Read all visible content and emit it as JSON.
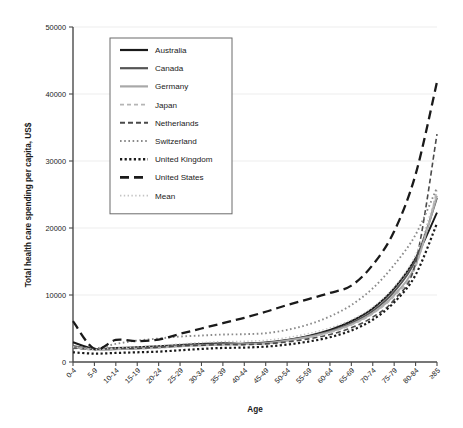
{
  "chart_data": {
    "type": "line",
    "title": "",
    "xlabel": "Age",
    "ylabel": "Total health care spending per capita, US$",
    "ylim": [
      0,
      50000
    ],
    "y_ticks": [
      0,
      10000,
      20000,
      30000,
      40000,
      50000
    ],
    "grid": true,
    "legend_position": "upper-left-inside",
    "categories": [
      "0-4",
      "5-9",
      "10-14",
      "15-19",
      "20-24",
      "25-29",
      "30-34",
      "35-39",
      "40-44",
      "45-49",
      "50-54",
      "55-59",
      "60-64",
      "65-69",
      "70-74",
      "75-79",
      "80-84",
      "≥85"
    ],
    "series": [
      {
        "name": "Australia",
        "style": "solid",
        "color": "#1a1a1a",
        "width": 1.9,
        "values": [
          2950,
          1950,
          2100,
          2200,
          2350,
          2550,
          2700,
          2800,
          2750,
          2900,
          3300,
          3900,
          4800,
          6100,
          8000,
          11000,
          15500,
          22300
        ]
      },
      {
        "name": "Canada",
        "style": "solid",
        "color": "#555555",
        "width": 1.9,
        "values": [
          2400,
          1900,
          1950,
          2050,
          2200,
          2450,
          2600,
          2700,
          2700,
          2850,
          3250,
          3800,
          4600,
          5800,
          7600,
          10500,
          15200,
          24500
        ]
      },
      {
        "name": "Germany",
        "style": "solid",
        "color": "#a8a8a8",
        "width": 1.9,
        "values": [
          2200,
          1850,
          1900,
          2000,
          2150,
          2350,
          2500,
          2600,
          2650,
          2800,
          3200,
          3750,
          4500,
          5600,
          7300,
          10000,
          14500,
          24800
        ]
      },
      {
        "name": "Japan",
        "style": "dashed-light",
        "color": "#b5b5b5",
        "width": 1.5,
        "values": [
          2050,
          1800,
          1900,
          1950,
          2100,
          2300,
          2450,
          2550,
          2600,
          2750,
          3100,
          3650,
          4400,
          5500,
          7200,
          9800,
          14200,
          25600
        ]
      },
      {
        "name": "Netherlands",
        "style": "dashed",
        "color": "#4a4a4a",
        "width": 1.6,
        "values": [
          2100,
          1900,
          2000,
          2050,
          2200,
          2400,
          2500,
          2600,
          2600,
          2700,
          3000,
          3450,
          4100,
          5100,
          6700,
          9300,
          14800,
          34000
        ]
      },
      {
        "name": "Switzerland",
        "style": "dotted",
        "color": "#8a8a8a",
        "width": 1.9,
        "values": [
          2300,
          2050,
          2700,
          3200,
          3500,
          3800,
          3950,
          4100,
          4150,
          4300,
          4800,
          5600,
          6800,
          8500,
          11000,
          14500,
          19000,
          26000
        ]
      },
      {
        "name": "United Kingdom",
        "style": "dotted-bold",
        "color": "#1a1a1a",
        "width": 2.2,
        "values": [
          1450,
          1250,
          1350,
          1450,
          1550,
          1750,
          1950,
          2100,
          2150,
          2300,
          2600,
          3050,
          3700,
          4700,
          6300,
          8900,
          13000,
          20700
        ]
      },
      {
        "name": "United States",
        "style": "longdash",
        "color": "#1a1a1a",
        "width": 2.3,
        "values": [
          6100,
          1950,
          3300,
          3100,
          3350,
          4200,
          5000,
          5800,
          6600,
          7500,
          8500,
          9400,
          10300,
          11400,
          14500,
          19500,
          28000,
          41800
        ]
      },
      {
        "name": "Mean",
        "style": "dotted-light",
        "color": "#c4c4c4",
        "width": 1.4,
        "values": [
          2250,
          1850,
          2100,
          2250,
          2450,
          2700,
          2900,
          3050,
          3100,
          3250,
          3650,
          4250,
          5100,
          6300,
          8200,
          11200,
          16000,
          25200
        ]
      }
    ]
  }
}
